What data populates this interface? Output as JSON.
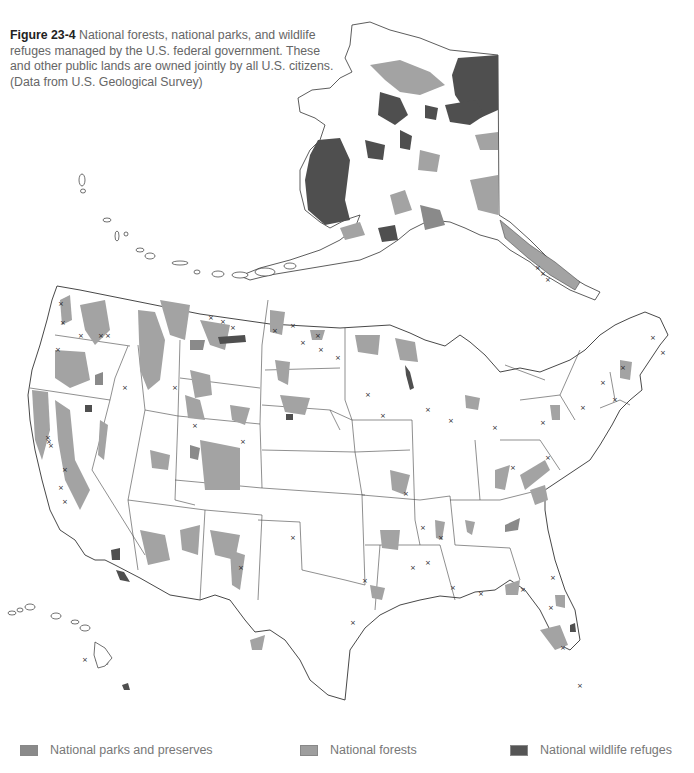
{
  "figure": {
    "label": "Figure 23-4",
    "caption": "National forests, national parks, and wildlife refuges managed by the U.S. federal government. These and other public lands are owned jointly by all U.S. citizens. (Data from U.S. Geological Survey)"
  },
  "map": {
    "subject": "Federal public lands of the United States",
    "regions_shown": [
      "Alaska",
      "Contiguous United States",
      "Hawaii",
      "Aleutian Islands"
    ],
    "markers": {
      "x_symbol": "×"
    }
  },
  "legend": {
    "items": [
      {
        "label": "National parks and preserves",
        "color": "#8a8a8a"
      },
      {
        "label": "National forests",
        "color": "#9e9e9e"
      },
      {
        "label": "National wildlife refuges",
        "color": "#555555"
      }
    ]
  },
  "colors": {
    "outline": "#333333",
    "park": "#8a8a8a",
    "forest": "#a3a3a3",
    "refuge": "#4f4f4f",
    "background": "#ffffff"
  }
}
